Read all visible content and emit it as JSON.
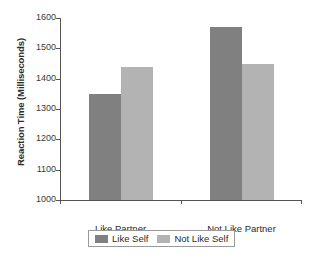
{
  "chart_data": {
    "type": "bar",
    "title": "",
    "xlabel": "",
    "ylabel": "Reaction Time (Milliseconds)",
    "categories": [
      "Like Partner",
      "Not Like Partner"
    ],
    "series": [
      {
        "name": "Like Self",
        "color": "#808080",
        "values": [
          1350,
          1570
        ]
      },
      {
        "name": "Not Like Self",
        "color": "#b3b3b3",
        "values": [
          1440,
          1450
        ]
      }
    ],
    "ylim": [
      1000,
      1600
    ],
    "ytick_values": [
      1000,
      1100,
      1200,
      1300,
      1400,
      1500,
      1600
    ],
    "ytick_labels": [
      "1000",
      "1100",
      "1200",
      "1300",
      "1400",
      "1500",
      "1600"
    ],
    "grid": false,
    "legend_position": "bottom",
    "axis_color": "#555555",
    "background_color": "#ffffff"
  }
}
